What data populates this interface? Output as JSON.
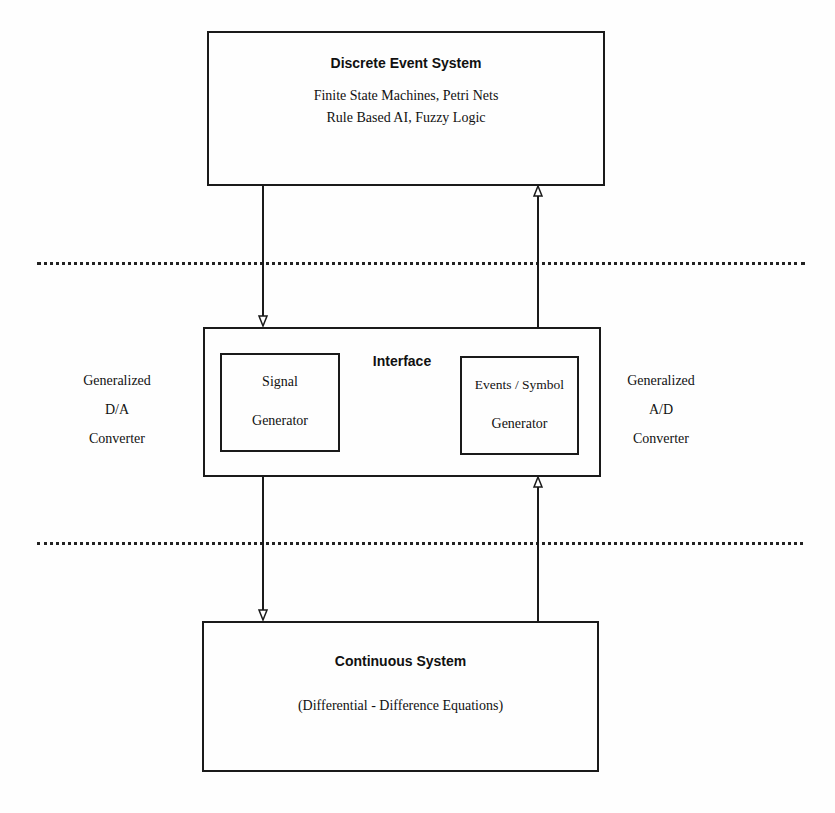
{
  "diagram": {
    "discrete_box": {
      "title": "Discrete Event System",
      "line1": "Finite State Machines,  Petri Nets",
      "line2": "Rule Based AI, Fuzzy Logic"
    },
    "interface_box": {
      "title": "Interface",
      "signal_generator": {
        "line1": "Signal",
        "line2": "Generator"
      },
      "event_generator": {
        "line1": "Events / Symbol",
        "line2": "Generator"
      }
    },
    "continuous_box": {
      "title": "Continuous System",
      "subtitle": "(Differential  -  Difference  Equations)"
    },
    "left_label": {
      "line1": "Generalized",
      "line2": "D/A",
      "line3": "Converter"
    },
    "right_label": {
      "line1": "Generalized",
      "line2": "A/D",
      "line3": "Converter"
    },
    "colors": {
      "stroke": "#1a1a1a",
      "background": "#fefefe"
    }
  }
}
